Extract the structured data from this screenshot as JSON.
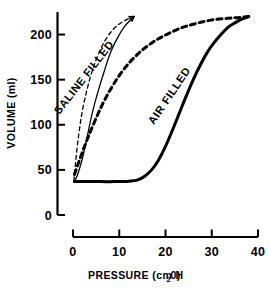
{
  "chart_data": {
    "type": "line",
    "title": "",
    "subtitle": "",
    "xlabel": "PRESSURE (cm H20)",
    "xlabel_main": "PRESSURE (cm H",
    "xlabel_sub": "2",
    "xlabel_tail": "0)",
    "ylabel": "VOLUME (ml)",
    "xlim": [
      0,
      40
    ],
    "ylim": [
      0,
      225
    ],
    "xticks": [
      0,
      10,
      20,
      30,
      40
    ],
    "xtick_labels": [
      "0",
      "10",
      "20",
      "30",
      "40"
    ],
    "yticks": [
      0,
      50,
      100,
      150,
      200
    ],
    "ytick_labels": [
      "0",
      "50",
      "100",
      "150",
      "200"
    ],
    "grid": false,
    "legend_position": "inline-curve-labels",
    "annotations": [
      {
        "text": "SALINE FILLED",
        "x": 3.0,
        "y": 150,
        "rotation": -52
      },
      {
        "text": "AIR FILLED",
        "x": 21.5,
        "y": 130,
        "rotation": -56
      }
    ],
    "series": [
      {
        "name": "SALINE FILLED inflation",
        "style": "solid-thin",
        "points": [
          [
            0.2,
            37
          ],
          [
            0.6,
            40
          ],
          [
            1.2,
            48
          ],
          [
            2.0,
            62
          ],
          [
            2.8,
            80
          ],
          [
            3.6,
            100
          ],
          [
            4.4,
            118
          ],
          [
            5.2,
            133
          ],
          [
            6.0,
            147
          ],
          [
            6.8,
            160
          ],
          [
            7.6,
            173
          ],
          [
            8.6,
            186
          ],
          [
            9.8,
            198
          ],
          [
            11.0,
            208
          ],
          [
            12.2,
            215
          ],
          [
            13.2,
            220
          ]
        ]
      },
      {
        "name": "SALINE FILLED deflation",
        "style": "dashed-thin",
        "points": [
          [
            0.2,
            38
          ],
          [
            0.5,
            55
          ],
          [
            0.9,
            75
          ],
          [
            1.4,
            95
          ],
          [
            2.0,
            115
          ],
          [
            2.8,
            134
          ],
          [
            3.7,
            152
          ],
          [
            4.7,
            168
          ],
          [
            5.8,
            182
          ],
          [
            7.0,
            194
          ],
          [
            8.4,
            204
          ],
          [
            9.8,
            211
          ],
          [
            11.4,
            216
          ],
          [
            12.8,
            219
          ],
          [
            13.2,
            220
          ]
        ]
      },
      {
        "name": "AIR FILLED inflation",
        "style": "solid-thick",
        "points": [
          [
            0.3,
            37
          ],
          [
            3.0,
            37
          ],
          [
            6.0,
            37
          ],
          [
            9.0,
            37
          ],
          [
            12.0,
            37.5
          ],
          [
            14.0,
            39
          ],
          [
            15.5,
            43
          ],
          [
            17.0,
            50
          ],
          [
            18.5,
            61
          ],
          [
            20.0,
            76
          ],
          [
            21.5,
            94
          ],
          [
            23.0,
            113
          ],
          [
            24.5,
            132
          ],
          [
            26.0,
            150
          ],
          [
            27.5,
            166
          ],
          [
            29.0,
            180
          ],
          [
            30.5,
            191
          ],
          [
            32.0,
            200
          ],
          [
            33.5,
            208
          ],
          [
            35.0,
            213
          ],
          [
            36.5,
            217
          ],
          [
            38.0,
            220
          ]
        ]
      },
      {
        "name": "AIR FILLED deflation",
        "style": "dashed-thick",
        "points": [
          [
            0.3,
            45
          ],
          [
            1.2,
            58
          ],
          [
            2.2,
            72
          ],
          [
            3.4,
            88
          ],
          [
            4.8,
            105
          ],
          [
            6.4,
            123
          ],
          [
            8.2,
            140
          ],
          [
            10.2,
            156
          ],
          [
            12.4,
            170
          ],
          [
            14.8,
            182
          ],
          [
            17.4,
            192
          ],
          [
            20.2,
            200
          ],
          [
            23.2,
            207
          ],
          [
            26.4,
            212
          ],
          [
            29.8,
            216
          ],
          [
            33.4,
            218
          ],
          [
            36.0,
            219
          ],
          [
            38.0,
            220
          ]
        ]
      }
    ]
  }
}
